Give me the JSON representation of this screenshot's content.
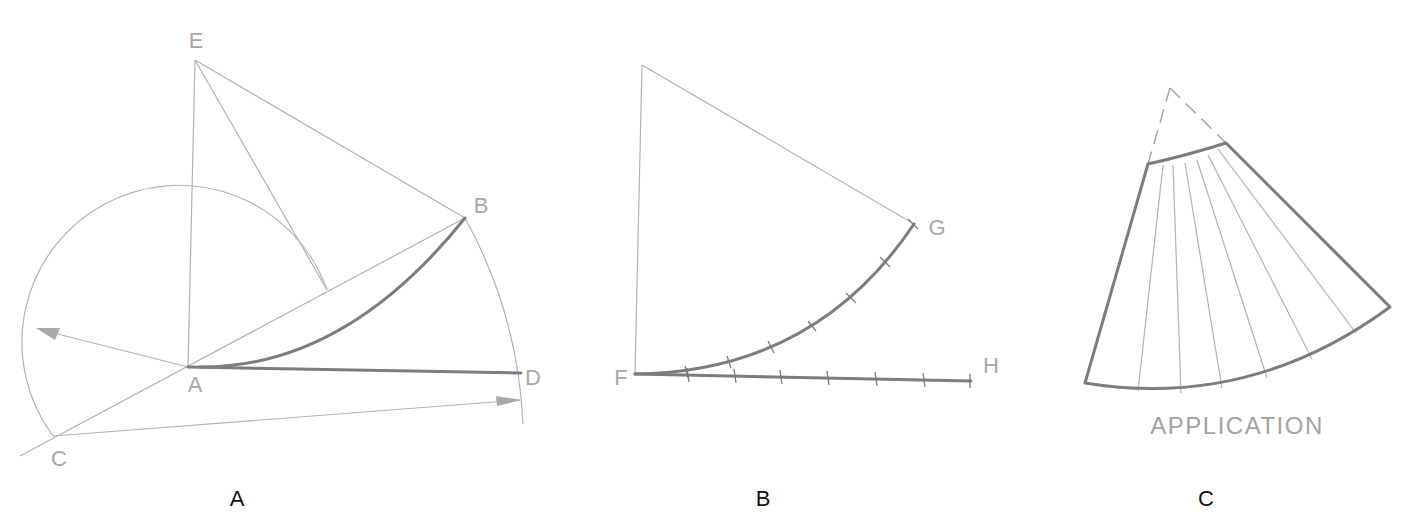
{
  "figure": {
    "panels": [
      {
        "id": "A",
        "caption": "A",
        "point_labels": {
          "E": "E",
          "B": "B",
          "A": "A",
          "D": "D",
          "C": "C"
        },
        "points": {
          "E": [
            195,
            60
          ],
          "B": [
            465,
            218
          ],
          "A": [
            188,
            367
          ],
          "D": [
            521,
            379
          ],
          "C": [
            53,
            436
          ]
        }
      },
      {
        "id": "B",
        "caption": "B",
        "point_labels": {
          "F": "F",
          "G": "G",
          "H": "H"
        },
        "points": {
          "apex": [
            642,
            65
          ],
          "F": [
            635,
            374
          ],
          "G": [
            914,
            224
          ],
          "H": [
            971,
            381
          ]
        },
        "divisions": 7
      },
      {
        "id": "C",
        "caption": "C",
        "title": "APPLICATION",
        "radial_lines": 6
      }
    ],
    "colors": {
      "construction_line": "#b3b3b3",
      "heavy_line": "#7c7c7c",
      "point_label": "#a8a8a8",
      "caption": "#111111"
    }
  }
}
